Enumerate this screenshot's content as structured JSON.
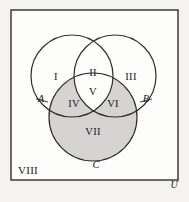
{
  "figure": {
    "kind": "venn-diagram",
    "background_color": "#f4f3f1",
    "shade_color": "#d5d4d2",
    "stroke_color": "#2e2e30",
    "text_color": "#19191b",
    "rect": {
      "x": 11,
      "y": 10,
      "width": 167,
      "height": 170
    },
    "circles": [
      {
        "name": "A",
        "cx": 72,
        "cy": 76,
        "r": 41,
        "shaded": false
      },
      {
        "name": "B",
        "cx": 115,
        "cy": 76,
        "r": 41,
        "shaded": false
      },
      {
        "name": "C",
        "cx": 93,
        "cy": 117,
        "r": 44,
        "shaded": true
      }
    ]
  },
  "set_labels": [
    {
      "text": "A",
      "x": 41,
      "y": 100
    },
    {
      "text": "B",
      "x": 146,
      "y": 100
    },
    {
      "text": "C",
      "x": 96,
      "y": 166
    }
  ],
  "regions": [
    {
      "id": "I",
      "text": "I",
      "x": 56,
      "y": 78,
      "shaded": false
    },
    {
      "id": "II",
      "text": "II",
      "x": 93,
      "y": 74,
      "shaded": false
    },
    {
      "id": "III",
      "text": "III",
      "x": 131,
      "y": 78,
      "shaded": false
    },
    {
      "id": "IV",
      "text": "IV",
      "x": 74,
      "y": 105,
      "shaded": true
    },
    {
      "id": "V",
      "text": "V",
      "x": 93,
      "y": 93,
      "shaded": false
    },
    {
      "id": "VI",
      "text": "VI",
      "x": 113,
      "y": 105,
      "shaded": true
    },
    {
      "id": "VII",
      "text": "VII",
      "x": 93,
      "y": 133,
      "shaded": true
    },
    {
      "id": "VIII",
      "text": "VIII",
      "x": 28,
      "y": 171,
      "shaded": false
    }
  ],
  "universe": {
    "label": "U",
    "x": 174,
    "y": 186
  }
}
